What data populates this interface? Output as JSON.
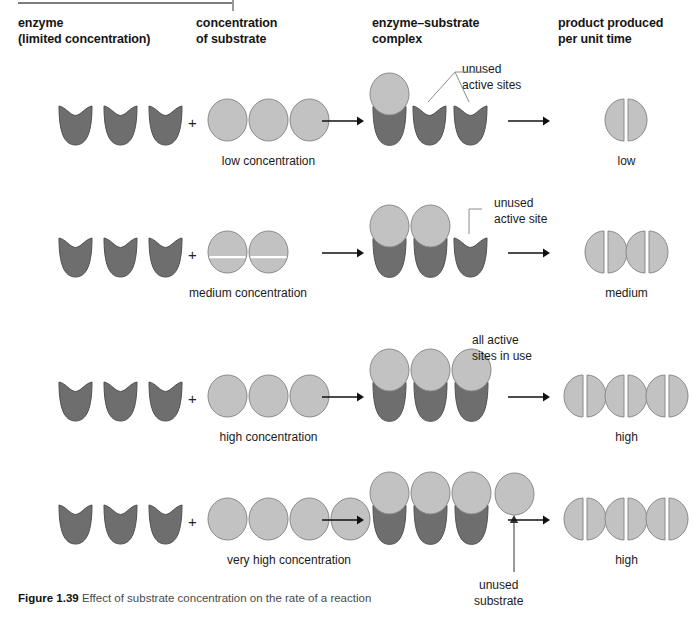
{
  "figure": {
    "number": "Figure 1.39",
    "caption": "Effect of substrate concentration on the rate of a reaction"
  },
  "headers": [
    {
      "id": "enzyme",
      "text": "enzyme\n(limited concentration)",
      "x": 18,
      "y": 16
    },
    {
      "id": "substrate",
      "text": "concentration\nof substrate",
      "x": 196,
      "y": 16
    },
    {
      "id": "complex",
      "text": "enzyme–substrate\ncomplex",
      "x": 372,
      "y": 16
    },
    {
      "id": "product",
      "text": "product produced\nper unit time",
      "x": 558,
      "y": 16
    }
  ],
  "colors": {
    "enzyme_fill": "#6e6e6e",
    "enzyme_stroke": "#4f4f4f",
    "substrate_fill": "#c2c2c2",
    "substrate_stroke": "#8a8a8a",
    "product_fill": "#c2c2c2",
    "product_stroke": "#8a8a8a",
    "product_split": "#ffffff",
    "arrow": "#111111",
    "leader": "#8c8c8c",
    "rule": "#7d7d7d",
    "text": "#1a1a1a",
    "caption_text": "#4a4a4a"
  },
  "rows": [
    {
      "id": "row-low",
      "enzyme_count": 3,
      "substrate_count": 3,
      "substrate_label": "low concentration",
      "substrate_divided": false,
      "complex_bound": 1,
      "complex_free_enzymes": 2,
      "complex_loose_substrate": 0,
      "annotation": "unused\nactive sites",
      "annotation_x": 462,
      "annotation_y": 62,
      "product_count": 1,
      "product_label": "low"
    },
    {
      "id": "row-medium",
      "enzyme_count": 3,
      "substrate_count": 2,
      "substrate_label": "medium concentration",
      "substrate_divided": true,
      "complex_bound": 2,
      "complex_free_enzymes": 1,
      "complex_loose_substrate": 0,
      "annotation": "unused\nactive site",
      "annotation_x": 494,
      "annotation_y": 196,
      "product_count": 2,
      "product_label": "medium"
    },
    {
      "id": "row-high",
      "enzyme_count": 3,
      "substrate_count": 3,
      "substrate_label": "high concentration",
      "substrate_divided": false,
      "complex_bound": 3,
      "complex_free_enzymes": 0,
      "complex_loose_substrate": 0,
      "annotation": "all active\nsites in use",
      "annotation_x": 472,
      "annotation_y": 333,
      "product_count": 3,
      "product_label": "high"
    },
    {
      "id": "row-very-high",
      "enzyme_count": 3,
      "substrate_count": 4,
      "substrate_label": "very high concentration",
      "substrate_divided": false,
      "complex_bound": 3,
      "complex_free_enzymes": 0,
      "complex_loose_substrate": 1,
      "annotation": "unused\nsubstrate",
      "annotation_x": 474,
      "annotation_y": 578,
      "product_count": 3,
      "product_label": "high"
    }
  ],
  "chart_data": {
    "type": "diagram",
    "title": "Effect of substrate concentration on the rate of a reaction",
    "categories": [
      "low concentration",
      "medium concentration",
      "high concentration",
      "very high concentration"
    ],
    "series": [
      {
        "name": "enzyme molecules (limited)",
        "values": [
          3,
          3,
          3,
          3
        ]
      },
      {
        "name": "substrate molecules",
        "values": [
          1,
          2,
          3,
          4
        ]
      },
      {
        "name": "enzyme–substrate complexes",
        "values": [
          1,
          2,
          3,
          3
        ]
      },
      {
        "name": "unused active sites",
        "values": [
          2,
          1,
          0,
          0
        ]
      },
      {
        "name": "unused substrate",
        "values": [
          0,
          0,
          0,
          1
        ]
      },
      {
        "name": "product produced per unit time",
        "values": [
          1,
          2,
          3,
          3
        ]
      }
    ],
    "rate_labels": [
      "low",
      "medium",
      "high",
      "high"
    ],
    "xlabel": "substrate concentration",
    "ylabel": "product produced per unit time"
  }
}
